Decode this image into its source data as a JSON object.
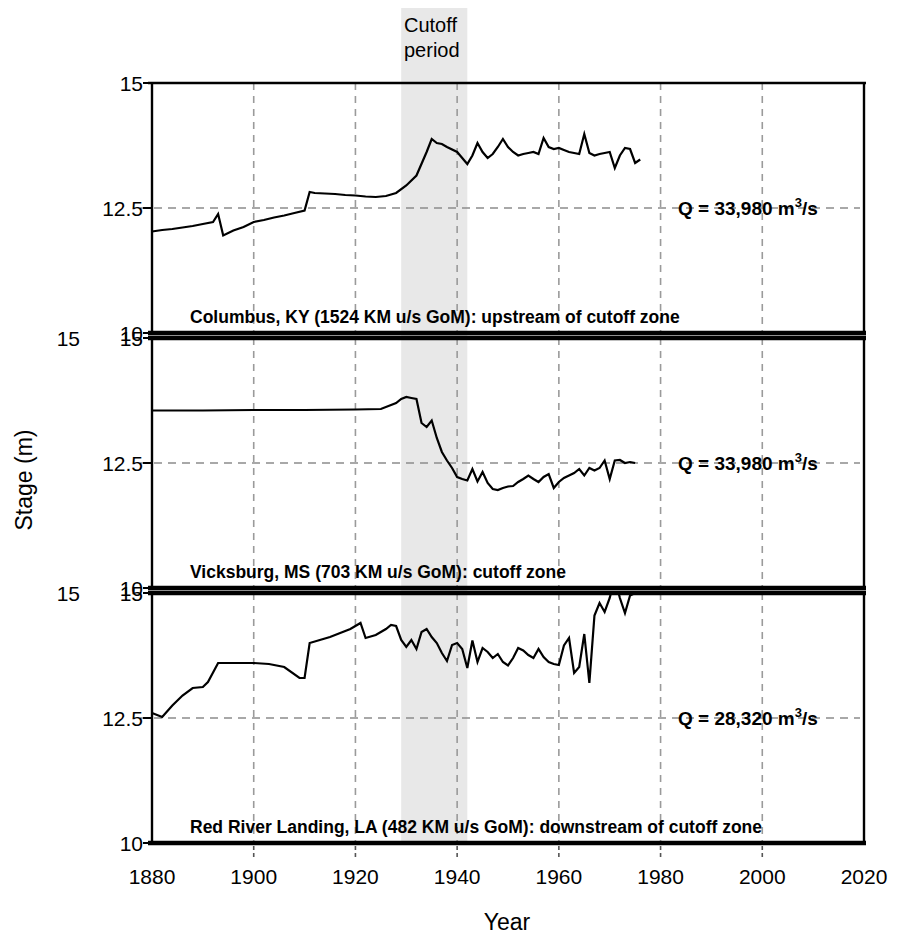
{
  "figure": {
    "x_axis_title": "Year",
    "y_axis_title": "Stage (m)",
    "cutoff_band_label_line1": "Cutoff",
    "cutoff_band_label_line2": "period",
    "cutoff_band_start_year": 1929,
    "cutoff_band_end_year": 1942,
    "x_ticks": [
      1880,
      1900,
      1920,
      1940,
      1960,
      1980,
      2000,
      2020
    ],
    "x_tick_labels": [
      "1880",
      "1900",
      "1920",
      "1940",
      "1960",
      "1980",
      "2000",
      "2020"
    ],
    "y_ticks": [
      10,
      12.5,
      15
    ],
    "y_tick_labels": [
      "10",
      "12.5",
      "15"
    ],
    "xlim": [
      1880,
      2020
    ],
    "ylim": [
      10,
      15
    ],
    "grid": "dashed vertical at x ticks; dashed horizontal at y=12.5",
    "panel_count": 3
  },
  "chart_data": {
    "type": "line",
    "title": "",
    "xlabel": "Year",
    "ylabel": "Stage (m)",
    "xlim": [
      1880,
      2020
    ],
    "ylim": [
      10,
      15
    ],
    "legend": "none",
    "annotations": [
      {
        "text": "Cutoff period",
        "x_range": [
          1929,
          1942
        ],
        "style": "shaded grey vertical band across all panels"
      }
    ],
    "panels": [
      {
        "name": "Columbus, KY",
        "caption": "Columbus, KY (1524 KM u/s GoM): upstream of cutoff zone",
        "discharge_label": "Q = 33,980 m3/s",
        "discharge_label_display": "Q = 33,980 m³/s",
        "discharge_reference_line_y": 12.5,
        "x": [
          1880,
          1882,
          1884,
          1886,
          1888,
          1890,
          1892,
          1893,
          1894,
          1896,
          1898,
          1900,
          1902,
          1904,
          1906,
          1908,
          1910,
          1911,
          1912,
          1914,
          1916,
          1918,
          1920,
          1922,
          1924,
          1926,
          1928,
          1930,
          1932,
          1934,
          1935,
          1936,
          1937,
          1938,
          1940,
          1941,
          1942,
          1943,
          1944,
          1945,
          1946,
          1947,
          1948,
          1949,
          1950,
          1951,
          1952,
          1953,
          1954,
          1955,
          1956,
          1957,
          1958,
          1959,
          1960,
          1961,
          1962,
          1963,
          1964,
          1965,
          1966,
          1967,
          1968,
          1969,
          1970,
          1971,
          1972,
          1973,
          1974,
          1975,
          1976
        ],
        "y": [
          12.03,
          12.06,
          12.08,
          12.11,
          12.14,
          12.18,
          12.22,
          12.38,
          11.95,
          12.05,
          12.12,
          12.22,
          12.26,
          12.31,
          12.35,
          12.4,
          12.45,
          12.82,
          12.8,
          12.79,
          12.78,
          12.76,
          12.75,
          12.73,
          12.72,
          12.74,
          12.8,
          12.95,
          13.15,
          13.62,
          13.88,
          13.8,
          13.78,
          13.72,
          13.62,
          13.5,
          13.38,
          13.55,
          13.8,
          13.62,
          13.5,
          13.58,
          13.72,
          13.88,
          13.72,
          13.62,
          13.55,
          13.58,
          13.6,
          13.62,
          13.58,
          13.9,
          13.72,
          13.68,
          13.7,
          13.66,
          13.62,
          13.6,
          13.58,
          13.98,
          13.6,
          13.55,
          13.58,
          13.6,
          13.62,
          13.3,
          13.55,
          13.7,
          13.68,
          13.4,
          13.47
        ],
        "y_axis_ticks": [
          10,
          12.5,
          15
        ]
      },
      {
        "name": "Vicksburg, MS",
        "caption": "Vicksburg, MS (703 KM u/s GoM): cutoff zone",
        "discharge_label": "Q = 33,980 m3/s",
        "discharge_label_display": "Q = 33,980 m³/s",
        "discharge_reference_line_y": 12.5,
        "x": [
          1880,
          1890,
          1900,
          1910,
          1920,
          1925,
          1928,
          1929,
          1930,
          1931,
          1932,
          1933,
          1934,
          1935,
          1936,
          1937,
          1938,
          1939,
          1940,
          1941,
          1942,
          1943,
          1944,
          1945,
          1946,
          1947,
          1948,
          1949,
          1950,
          1951,
          1952,
          1953,
          1954,
          1955,
          1956,
          1957,
          1958,
          1959,
          1960,
          1961,
          1962,
          1963,
          1964,
          1965,
          1966,
          1967,
          1968,
          1969,
          1970,
          1971,
          1972,
          1973,
          1974,
          1975
        ],
        "y": [
          13.55,
          13.55,
          13.56,
          13.56,
          13.57,
          13.58,
          13.7,
          13.78,
          13.82,
          13.8,
          13.78,
          13.3,
          13.22,
          13.35,
          13.0,
          12.72,
          12.55,
          12.4,
          12.22,
          12.18,
          12.15,
          12.38,
          12.13,
          12.32,
          12.1,
          11.98,
          11.96,
          12.0,
          12.03,
          12.04,
          12.12,
          12.18,
          12.25,
          12.18,
          12.12,
          12.22,
          12.28,
          12.0,
          12.12,
          12.2,
          12.25,
          12.3,
          12.38,
          12.25,
          12.4,
          12.35,
          12.4,
          12.55,
          12.18,
          12.55,
          12.56,
          12.5,
          12.52,
          12.5
        ],
        "y_axis_ticks": [
          10,
          12.5,
          15
        ]
      },
      {
        "name": "Red River Landing, LA",
        "caption": "Red River Landing, LA (482 KM u/s GoM): downstream of cutoff zone",
        "discharge_label": "Q = 28,320 m3/s",
        "discharge_label_display": "Q = 28,320 m³/s",
        "discharge_reference_line_y": 12.5,
        "x": [
          1880,
          1882,
          1884,
          1886,
          1888,
          1890,
          1891,
          1893,
          1895,
          1898,
          1900,
          1903,
          1906,
          1909,
          1910,
          1911,
          1913,
          1915,
          1917,
          1919,
          1921,
          1922,
          1924,
          1926,
          1927,
          1928,
          1929,
          1930,
          1931,
          1932,
          1933,
          1934,
          1935,
          1936,
          1937,
          1938,
          1939,
          1940,
          1941,
          1942,
          1943,
          1944,
          1945,
          1946,
          1947,
          1948,
          1949,
          1950,
          1951,
          1952,
          1953,
          1954,
          1955,
          1956,
          1957,
          1958,
          1959,
          1960,
          1961,
          1962,
          1963,
          1964,
          1965,
          1966,
          1967,
          1968,
          1969,
          1970,
          1971,
          1972,
          1973,
          1974,
          1975,
          1976
        ],
        "y": [
          12.6,
          12.52,
          12.75,
          12.95,
          13.1,
          13.12,
          13.22,
          13.6,
          13.6,
          13.6,
          13.6,
          13.58,
          13.52,
          13.3,
          13.3,
          14.0,
          14.06,
          14.12,
          14.2,
          14.28,
          14.4,
          14.1,
          14.16,
          14.28,
          14.36,
          14.34,
          14.06,
          13.92,
          14.06,
          13.88,
          14.22,
          14.28,
          14.12,
          14.0,
          13.8,
          13.64,
          13.96,
          14.0,
          13.88,
          13.5,
          14.05,
          13.62,
          13.9,
          13.82,
          13.7,
          13.78,
          13.62,
          13.55,
          13.7,
          13.9,
          13.85,
          13.76,
          13.7,
          13.88,
          13.72,
          13.62,
          13.58,
          13.56,
          13.95,
          14.1,
          13.4,
          13.52,
          14.18,
          13.2,
          14.55,
          14.8,
          14.62,
          14.9,
          15.3,
          14.9,
          14.6,
          14.95,
          15.0,
          15.1
        ],
        "y_axis_ticks": [
          10,
          12.5,
          15
        ]
      }
    ]
  }
}
